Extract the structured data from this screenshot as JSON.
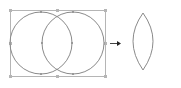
{
  "diagram": {
    "colors": {
      "stroke": "#8a8a8a",
      "bbox": "#b5b5b5",
      "arrow": "#444444",
      "background": "#ffffff"
    },
    "before": {
      "bbox": {
        "x": 10,
        "y": 10,
        "w": 95,
        "h": 66
      },
      "circles": [
        {
          "cx": 41,
          "cy": 43,
          "r": 31
        },
        {
          "cx": 73,
          "cy": 43,
          "r": 31
        }
      ]
    },
    "arrow": {
      "x1": 110,
      "y1": 43,
      "x2": 121,
      "y2": 43
    },
    "after": {
      "shape": "lens",
      "top": {
        "x": 143,
        "y": 13
      },
      "bottom": {
        "x": 143,
        "y": 70
      },
      "left_x": 127,
      "right_x": 159
    }
  }
}
